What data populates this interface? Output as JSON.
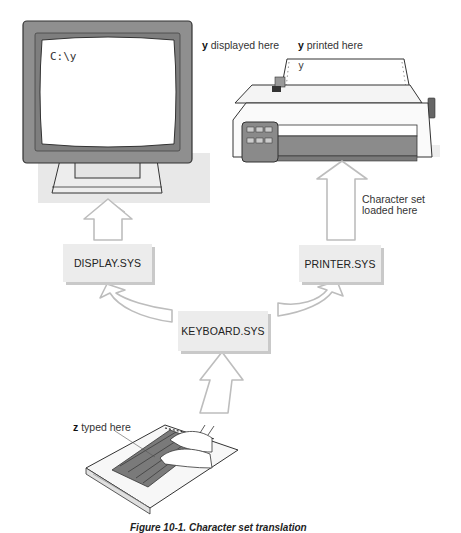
{
  "diagram": {
    "monitor": {
      "screen_text": "C:\\y",
      "annotation_bold": "y",
      "annotation_rest": " displayed here"
    },
    "printer": {
      "paper_text": "y",
      "annotation_bold": "y",
      "annotation_rest": " printed here",
      "charset_note_line1": "Character set",
      "charset_note_line2": "loaded here"
    },
    "keyboard": {
      "annotation_bold": "z",
      "annotation_rest": " typed here"
    },
    "drivers": {
      "display": "DISPLAY.SYS",
      "printer": "PRINTER.SYS",
      "keyboard": "KEYBOARD.SYS"
    },
    "flows": [
      {
        "from": "keyboard",
        "to": "KEYBOARD.SYS"
      },
      {
        "from": "KEYBOARD.SYS",
        "to": "DISPLAY.SYS"
      },
      {
        "from": "KEYBOARD.SYS",
        "to": "PRINTER.SYS"
      },
      {
        "from": "DISPLAY.SYS",
        "to": "monitor"
      },
      {
        "from": "PRINTER.SYS",
        "to": "printer"
      }
    ],
    "caption": "Figure 10-1.  Character set translation"
  }
}
